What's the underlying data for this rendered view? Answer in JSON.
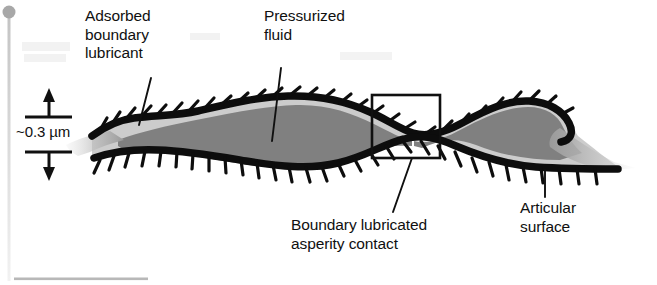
{
  "figure": {
    "width": 657,
    "height": 285,
    "background_color": "#ffffff"
  },
  "labels": {
    "adsorbed_lubricant": "Adsorbed\nboundary\nlubricant",
    "pressurized_fluid": "Pressurized\nfluid",
    "film_thickness": "~0.3 µm",
    "asperity_contact": "Boundary lubricated\nasperity contact",
    "articular_surface": "Articular\nsurface"
  },
  "colors": {
    "ink": "#101010",
    "surface_line": "#0d0d0d",
    "fluid_dark_gray": "#808080",
    "fluid_light_gray": "#c9c9c9",
    "fluid_fade_gray": "#d8d8d8",
    "artifact_gray": "#b4b4b4",
    "background": "#ffffff"
  },
  "annotations": {
    "dimension_value": "~0.3 µm",
    "dimension_axis": "vertical",
    "callout_box": {
      "name": "asperity-contact-box",
      "x": 372,
      "y": 95,
      "width": 68,
      "height": 63
    },
    "leader_lines": [
      {
        "name": "leader-adsorbed-lubricant",
        "x1": 151,
        "y1": 78,
        "x2": 139,
        "y2": 124
      },
      {
        "name": "leader-pressurized-fluid",
        "x1": 281,
        "y1": 68,
        "x2": 272,
        "y2": 140
      },
      {
        "name": "leader-asperity-contact",
        "x1": 412,
        "y1": 158,
        "x2": 393,
        "y2": 211
      },
      {
        "name": "leader-articular-surface",
        "x1": 545,
        "y1": 170,
        "x2": 545,
        "y2": 197
      }
    ]
  },
  "geometry": {
    "upper_surface_path": "M 92,135 C 104,126 116,119 132,117 C 152,114 172,115 196,110 C 226,104 254,97 286,95 C 318,93 344,99 368,110 C 384,117 398,127 412,131 C 428,136 444,131 462,122 C 486,110 506,100 528,100 C 548,100 562,109 568,121 C 573,131 570,139 560,141",
    "lower_surface_path": "M 94,157 C 112,151 132,149 156,150 C 186,151 214,155 244,160 C 276,165 306,170 336,163 C 362,157 382,144 402,139 C 420,134 436,138 454,146 C 480,157 506,165 534,167 C 564,169 592,169 616,169",
    "fluid_region_note": "Lens-shaped pressurized fluid film between the two articular surfaces, pinched to near contact inside the callout box",
    "bristle_count_upper": 26,
    "bristle_count_lower": 27,
    "bristle_length": 13
  },
  "artifacts": {
    "corner_dot": {
      "name": "scan-dot",
      "cx": 9,
      "cy": 12,
      "r": 6,
      "color": "#a8a8a8"
    },
    "vertical_streak": {
      "x": 9,
      "y1": 18,
      "y2": 285,
      "color": "#dcdcdc"
    },
    "bottom_rule": {
      "x1": 14,
      "y1": 279,
      "x2": 148,
      "y2": 279,
      "color": "#b8b8b8"
    }
  }
}
